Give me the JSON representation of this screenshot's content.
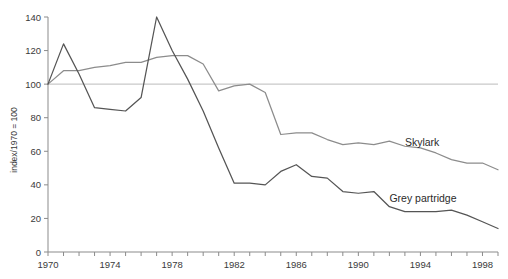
{
  "chart_data": {
    "type": "line",
    "title": "",
    "xlabel": "",
    "ylabel": "index/1970 = 100",
    "xlim": [
      1970,
      1999
    ],
    "ylim": [
      0,
      140
    ],
    "grid": false,
    "legend_position": "inline-right-of-series",
    "y_ticks": [
      0,
      20,
      40,
      60,
      80,
      100,
      120,
      140
    ],
    "x_ticks": [
      1970,
      1971,
      1972,
      1973,
      1974,
      1975,
      1976,
      1977,
      1978,
      1979,
      1980,
      1981,
      1982,
      1983,
      1984,
      1985,
      1986,
      1987,
      1988,
      1989,
      1990,
      1991,
      1992,
      1993,
      1994,
      1995,
      1996,
      1997,
      1998,
      1999
    ],
    "x_tick_labels": [
      "1970",
      "",
      "",
      "",
      "1974",
      "",
      "",
      "",
      "1978",
      "",
      "",
      "",
      "1982",
      "",
      "",
      "",
      "1986",
      "",
      "",
      "",
      "1990",
      "",
      "",
      "",
      "1994",
      "",
      "",
      "",
      "1998",
      ""
    ],
    "reference_line": {
      "value": 100,
      "color": "#c9c9c9"
    },
    "x": [
      1970,
      1971,
      1972,
      1973,
      1974,
      1975,
      1976,
      1977,
      1978,
      1979,
      1980,
      1981,
      1982,
      1983,
      1984,
      1985,
      1986,
      1987,
      1988,
      1989,
      1990,
      1991,
      1992,
      1993,
      1994,
      1995,
      1996,
      1997,
      1998,
      1999
    ],
    "series": [
      {
        "name": "Skylark",
        "color": "#8c8c8c",
        "label_x": 1993,
        "label_y": 63,
        "values": [
          100,
          108,
          108,
          110,
          111,
          113,
          113,
          116,
          117,
          117,
          112,
          96,
          99,
          100,
          95,
          70,
          71,
          71,
          67,
          64,
          65,
          64,
          66,
          63,
          62,
          59,
          55,
          53,
          53,
          49
        ]
      },
      {
        "name": "Grey partridge",
        "color": "#555555",
        "label_x": 1992,
        "label_y": 30,
        "values": [
          100,
          124,
          106,
          86,
          85,
          84,
          92,
          140,
          120,
          103,
          84,
          62,
          41,
          41,
          40,
          48,
          52,
          45,
          44,
          36,
          35,
          36,
          27,
          24,
          24,
          24,
          25,
          22,
          18,
          14
        ]
      }
    ]
  },
  "axis": {
    "y_title": "index/1970 = 100"
  },
  "labels": {
    "skylark": "Skylark",
    "grey_partridge": "Grey partridge"
  }
}
